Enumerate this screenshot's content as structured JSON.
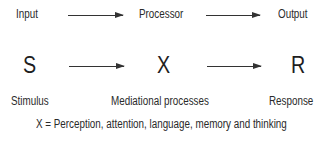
{
  "top_row": {
    "input": "Input",
    "processor": "Processor",
    "output": "Output"
  },
  "middle_row": {
    "stimulus_symbol": "S",
    "mediation_symbol": "X",
    "response_symbol": "R"
  },
  "labels": {
    "stimulus": "Stimulus",
    "mediational": "Mediational processes",
    "response": "Response"
  },
  "footnote": "X = Perception, attention, language, memory and thinking"
}
